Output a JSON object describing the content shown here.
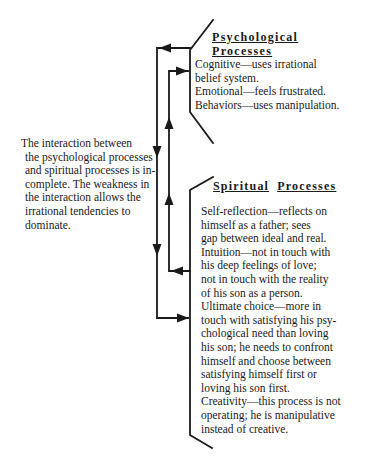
{
  "top_cut_text": "p                                         p",
  "psychological": {
    "heading_line1": "Psychological",
    "heading_line2": "Processes",
    "lines": [
      "Cognitive—uses irrational",
      "belief system.",
      "Emotional—feels frustrated.",
      "Behaviors—uses manipulation."
    ]
  },
  "spiritual": {
    "heading_word1": "Spiritual",
    "heading_word2": "Processes",
    "lines": [
      "Self-reflection—reflects on",
      "himself as a father; sees",
      "gap between ideal and real.",
      "Intuition—not in touch with",
      "his deep feelings of love;",
      "not in touch with the reality",
      "of his son as a person.",
      "Ultimate choice—more in",
      "touch with satisfying his psy-",
      "chological need than loving",
      "his son; he needs to confront",
      "himself and choose between",
      "satisfying himself first or",
      "loving his son first.",
      "Creativity—this process is not",
      "operating; he is manipulative",
      "instead of creative."
    ]
  },
  "interaction_note": {
    "lines": [
      "The interaction between",
      "the psychological processes",
      "and spiritual processes is in-",
      "complete. The weakness in",
      "the interaction allows the",
      "irrational tendencies to",
      "dominate."
    ]
  },
  "colors": {
    "ink": "#1a1a1a",
    "background": "#ffffff"
  }
}
